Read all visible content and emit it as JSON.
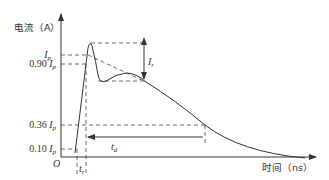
{
  "diagram": {
    "y_axis_label": "电流（A）",
    "x_axis_label": "时间（ns）",
    "origin_label": "O",
    "y_ticks": [
      {
        "coef": "",
        "sym": "I",
        "sub": "p",
        "label": "Ip"
      },
      {
        "coef": "0.90 ",
        "sym": "I",
        "sub": "p",
        "label": "0.90 Ip"
      },
      {
        "coef": "0.36 ",
        "sym": "I",
        "sub": "p",
        "label": "0.36 Ip"
      },
      {
        "coef": "0.10 ",
        "sym": "I",
        "sub": "p",
        "label": "0.10 Ip"
      }
    ],
    "annotations": {
      "ringing": {
        "sym": "I",
        "sub": "r",
        "label": "Ir"
      },
      "rise_time": {
        "sym": "t",
        "sub": "r",
        "label": "tr"
      },
      "decay_time": {
        "sym": "t",
        "sub": "d",
        "label": "td"
      }
    },
    "colors": {
      "stroke": "#333333",
      "dash": "#444444",
      "background": "#ffffff"
    }
  }
}
